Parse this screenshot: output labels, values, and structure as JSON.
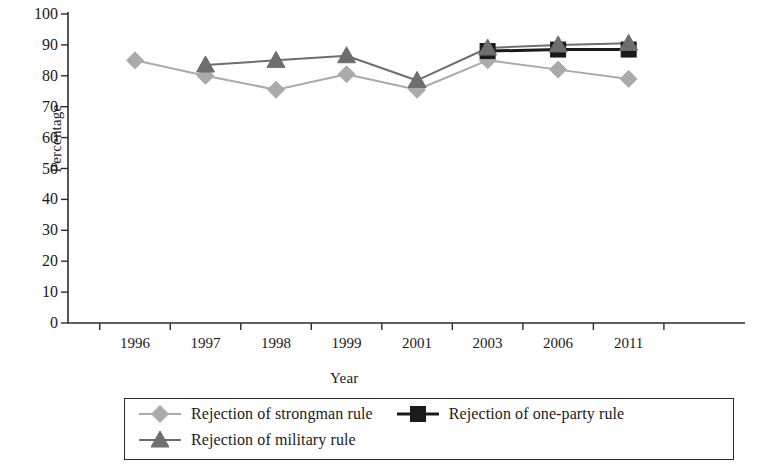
{
  "chart_data": {
    "type": "line",
    "title": "",
    "subtitle": "",
    "xlabel": "Year",
    "ylabel": "Percentage",
    "categories": [
      "1996",
      "1997",
      "1998",
      "1999",
      "2001",
      "2003",
      "2006",
      "2011"
    ],
    "ylim": [
      0,
      100
    ],
    "ytick_labels": [
      "0",
      "10",
      "20",
      "30",
      "40",
      "50",
      "60",
      "70",
      "80",
      "90",
      "100"
    ],
    "ytick_values": [
      0,
      10,
      20,
      30,
      40,
      50,
      60,
      70,
      80,
      90,
      100
    ],
    "grid": false,
    "legend_position": "bottom",
    "series": [
      {
        "name": "Rejection of strongman rule",
        "marker": "diamond",
        "color": "#aaaaaa",
        "values": [
          85,
          80,
          75.5,
          80.5,
          75.5,
          85,
          82,
          79
        ]
      },
      {
        "name": "Rejection of one-party rule",
        "marker": "square",
        "color": "#1a1a1a",
        "values": [
          null,
          null,
          null,
          null,
          null,
          88,
          88.5,
          88.5
        ]
      },
      {
        "name": "Rejection of military rule",
        "marker": "triangle",
        "color": "#6e6e6e",
        "values": [
          null,
          83.5,
          85,
          86.5,
          78.5,
          89,
          90,
          90.5
        ]
      }
    ]
  },
  "axes": {
    "y_axis_title": "Percentage",
    "x_axis_title": "Year"
  },
  "legend": {
    "entries": [
      {
        "label": "Rejection of strongman rule",
        "marker": "diamond-marker-icon",
        "color": "#aaaaaa"
      },
      {
        "label": "Rejection of one-party rule",
        "marker": "square-marker-icon",
        "color": "#1a1a1a"
      },
      {
        "label": "Rejection of military rule",
        "marker": "triangle-marker-icon",
        "color": "#6e6e6e"
      }
    ]
  },
  "colors": {
    "axis": "#2b2b2b",
    "strongman": "#aaaaaa",
    "one_party": "#1a1a1a",
    "military": "#6e6e6e",
    "background": "#ffffff"
  }
}
